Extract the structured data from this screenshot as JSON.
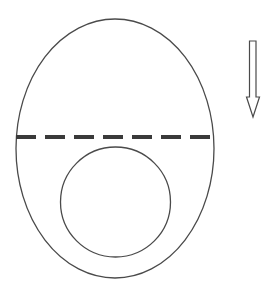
{
  "diagram": {
    "background": "#ffffff",
    "stroke_color": "#4a4a4a",
    "dash_color": "#3a3a3a",
    "outer_ellipse": {
      "cx": 115,
      "cy": 148.5,
      "rx": 99,
      "ry": 129.5,
      "stroke_width": 1.3
    },
    "divider_line": {
      "x1": 16,
      "y1": 137,
      "x2": 214,
      "y2": 137,
      "stroke_width": 4,
      "dash": "20 9"
    },
    "inner_circle": {
      "cx": 115.5,
      "cy": 202,
      "r": 55,
      "stroke_width": 1.3
    },
    "arrow": {
      "direction": "down",
      "points": "249.5,41 256,41 256,97 259.5,97 253,117 246.5,97 249.5,97",
      "stroke_width": 1.2
    }
  }
}
